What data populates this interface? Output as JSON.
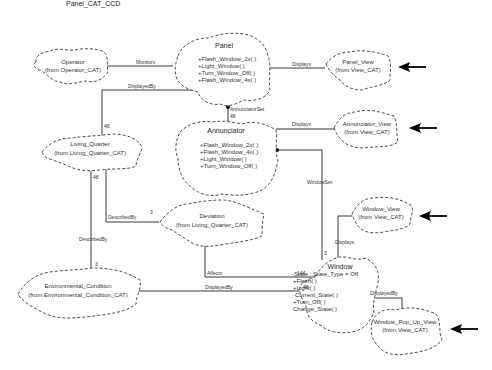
{
  "title": "Panel_CAT_CCD",
  "classes": [
    {
      "id": "operator",
      "name": "Operator",
      "source": "(from Operator_CAT)",
      "members": []
    },
    {
      "id": "panel",
      "name": "Panel",
      "source": "",
      "members": [
        "+Flash_Window_2x( )",
        "+Light_Window( )",
        "+Turn_Window_Off( )",
        "+Flash_Window_4x( )"
      ]
    },
    {
      "id": "panel_view",
      "name": "Panel_View",
      "source": "(from View_CAT)",
      "members": []
    },
    {
      "id": "living_quarter",
      "name": "Living_Quarter",
      "source": "(from Living_Quarter_CAT)",
      "members": []
    },
    {
      "id": "annunciator",
      "name": "Annunciator",
      "source": "",
      "members": [
        "+Flash_Window_2x( )",
        "+Flash_Window_4x( )",
        "+Light_Window( )",
        "+Turn_Window_Off( )"
      ]
    },
    {
      "id": "annunciator_view",
      "name": "Annunciator_View",
      "source": "(from View_CAT)",
      "members": []
    },
    {
      "id": "deviation",
      "name": "Deviation",
      "source": "(from Living_Quarter_CAT)",
      "members": []
    },
    {
      "id": "window_view",
      "name": "Window_View",
      "source": "(from View_CAT)",
      "members": []
    },
    {
      "id": "environmental_condition",
      "name": "Environmental_Condition",
      "source": "(from Environmental_Condition_CAT)",
      "members": []
    },
    {
      "id": "window",
      "name": "Window",
      "source": "",
      "members": [
        "-State : State_Type = Off",
        "+Flash( )",
        "+Light( )",
        "-Current_State( )",
        "+Turn_Off( )",
        "Change_State( )"
      ]
    },
    {
      "id": "window_pop_up_view",
      "name": "Window_Pop_Up_View",
      "source": "(from View_CAT)",
      "members": []
    }
  ],
  "relations": [
    {
      "label": "Monitors",
      "from": "operator",
      "to": "panel"
    },
    {
      "label": "Displays",
      "from": "panel",
      "to": "panel_view"
    },
    {
      "label": "DisplayedBy",
      "from": "living_quarter",
      "to": "panel",
      "multiplicity": "48"
    },
    {
      "label": "AnnunciatorSet",
      "from": "panel",
      "to": "annunciator",
      "multiplicity": "48"
    },
    {
      "label": "Displays",
      "from": "annunciator",
      "to": "annunciator_view"
    },
    {
      "label": "WindowSet",
      "from": "annunciator",
      "to": "window",
      "multiplicity": "3"
    },
    {
      "label": "DescribedBy",
      "from": "living_quarter",
      "to": "deviation",
      "multiplicity": "3"
    },
    {
      "label": "DescribedBy",
      "from": "living_quarter",
      "to": "environmental_condition",
      "multiplicity_from": "48",
      "multiplicity": "3"
    },
    {
      "label": "Affects",
      "from": "deviation",
      "to": "window",
      "multiplicity": "144"
    },
    {
      "label": "DisplayedBy",
      "from": "environmental_condition",
      "to": "window",
      "multiplicity": "48"
    },
    {
      "label": "Displays",
      "from": "window",
      "to": "window_view"
    },
    {
      "label": "DisplayedBy",
      "from": "window",
      "to": "window_pop_up_view"
    }
  ],
  "labels": {
    "monitors": "Monitors",
    "displays_panel": "Displays",
    "displayedby_lq": "DisplayedBy",
    "annunciatorset": "AnnunciatorSet",
    "mult_48_ann": "48",
    "mult_48_lq": "48",
    "displays_ann": "Displays",
    "windowset": "WindowSet",
    "mult_48_lq2": "48",
    "describedby_dev": "DescribedBy",
    "mult_3_dev": "3",
    "describedby_env": "DescribedBy",
    "mult_3_env": "3",
    "affects": "Affects",
    "mult_144": "144",
    "displayedby_env": "DisplayedBy",
    "mult_48_win": "48",
    "displays_win": "Displays",
    "mult_3_win": "3",
    "displayedby_win": "DisplayedBy"
  },
  "annotations": {
    "arrows": [
      "panel_view",
      "annunciator_view",
      "window_view",
      "window_pop_up_view"
    ],
    "arrow_icon": "left-arrow-icon"
  }
}
